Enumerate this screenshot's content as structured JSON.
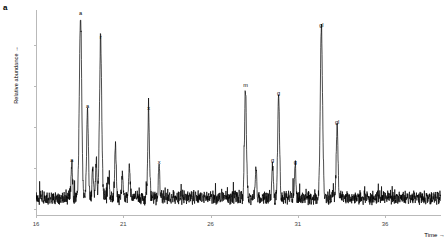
{
  "panel": {
    "label": "a"
  },
  "axes": {
    "ylabel": "Relative abundance →",
    "xlabel": "Time →",
    "x_ticks": [
      16,
      21,
      26,
      31,
      36
    ],
    "x_range": [
      16,
      39.2
    ],
    "y_ticks": 5,
    "y_tick_labels_shown": false,
    "grid": false,
    "axis_color": "#b9b9b9",
    "trace_color": "#000000"
  },
  "chart_data": {
    "type": "line",
    "title": "",
    "subtitle": "",
    "xlabel": "Time →",
    "ylabel": "Relative abundance →",
    "xlim": [
      16,
      39.2
    ],
    "ylim": [
      0,
      100
    ],
    "grid": false,
    "legend": "none",
    "series": [
      {
        "name": "Total ion chromatogram",
        "color": "#000000",
        "baseline_noise_level": 6,
        "peaks": [
          {
            "time": 18.05,
            "height": 17,
            "label": "a",
            "label_y": 22
          },
          {
            "time": 18.55,
            "height": 91,
            "label": "a",
            "label_y": 96
          },
          {
            "time": 18.95,
            "height": 44,
            "label": "a",
            "label_y": 49
          },
          {
            "time": 19.25,
            "height": 14,
            "label": "",
            "label_y": 0
          },
          {
            "time": 19.45,
            "height": 18,
            "label": "",
            "label_y": 0
          },
          {
            "time": 19.7,
            "height": 79,
            "label": "r",
            "label_y": 84
          },
          {
            "time": 20.15,
            "height": 11,
            "label": "",
            "label_y": 0
          },
          {
            "time": 20.55,
            "height": 27,
            "label": "",
            "label_y": 0
          },
          {
            "time": 20.95,
            "height": 12,
            "label": "",
            "label_y": 0
          },
          {
            "time": 21.35,
            "height": 16,
            "label": "",
            "label_y": 0
          },
          {
            "time": 22.45,
            "height": 43,
            "label": "x",
            "label_y": 48
          },
          {
            "time": 23.05,
            "height": 16,
            "label": "x",
            "label_y": 21
          },
          {
            "time": 28.0,
            "height": 55,
            "label": "m",
            "label_y": 60
          },
          {
            "time": 28.6,
            "height": 14,
            "label": "",
            "label_y": 0
          },
          {
            "time": 29.55,
            "height": 17,
            "label": "g",
            "label_y": 22
          },
          {
            "time": 29.9,
            "height": 51,
            "label": "g",
            "label_y": 56
          },
          {
            "time": 30.85,
            "height": 16,
            "label": "g",
            "label_y": 21
          },
          {
            "time": 32.35,
            "height": 85,
            "label": "gl",
            "label_y": 90
          },
          {
            "time": 33.25,
            "height": 36,
            "label": "gl",
            "label_y": 41
          }
        ]
      }
    ]
  }
}
